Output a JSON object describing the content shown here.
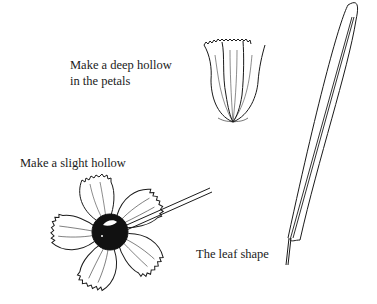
{
  "labels": {
    "deep_hollow_line1": "Make a deep hollow",
    "deep_hollow_line2": "in the petals",
    "slight_hollow": "Make a slight hollow",
    "leaf_shape": "The leaf shape"
  },
  "illustrations": {
    "cupped_petals": "cupped-petals-icon",
    "flower_with_tool": "flower-with-ball-tool-icon",
    "leaf": "leaf-icon"
  },
  "colors": {
    "ink": "#1a1a1a",
    "background": "#ffffff"
  }
}
